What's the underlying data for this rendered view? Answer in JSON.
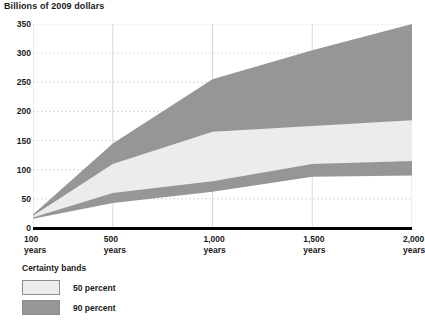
{
  "chart_data": {
    "type": "area",
    "title": "",
    "ylabel": "Billions of 2009 dollars",
    "xlabel": "",
    "grid": true,
    "legend_position": "below-left",
    "ylim": [
      0,
      350
    ],
    "xlim": [
      100,
      2000
    ],
    "y_ticks": [
      "350",
      "300",
      "250",
      "200",
      "150",
      "100",
      "50",
      "0"
    ],
    "y_tick_values": [
      350,
      300,
      250,
      200,
      150,
      100,
      50,
      0
    ],
    "x_ticks": [
      {
        "num": "100",
        "unit": "years"
      },
      {
        "num": "500",
        "unit": "years"
      },
      {
        "num": "1,000",
        "unit": "years"
      },
      {
        "num": "1,500",
        "unit": "years"
      },
      {
        "num": "2,000",
        "unit": "years"
      }
    ],
    "x_tick_values": [
      100,
      500,
      1000,
      1500,
      2000
    ],
    "x": [
      100,
      500,
      1000,
      1500,
      2000
    ],
    "series": [
      {
        "name": "90 percent upper",
        "values": [
          23,
          145,
          255,
          305,
          350
        ]
      },
      {
        "name": "50 percent upper",
        "values": [
          21,
          110,
          165,
          175,
          185
        ]
      },
      {
        "name": "50 percent lower",
        "values": [
          18,
          60,
          80,
          110,
          115
        ]
      },
      {
        "name": "90 percent lower",
        "values": [
          16,
          43,
          62,
          88,
          90
        ]
      }
    ],
    "bands": [
      {
        "name": "90 percent",
        "color": "#969696",
        "upper": [
          23,
          145,
          255,
          305,
          350
        ],
        "lower": [
          16,
          43,
          62,
          88,
          90
        ]
      },
      {
        "name": "50 percent",
        "color": "#ececec",
        "upper": [
          21,
          110,
          165,
          175,
          185
        ],
        "lower": [
          18,
          60,
          80,
          110,
          115
        ]
      }
    ],
    "colors": {
      "band_90": "#969696",
      "band_50": "#ececec",
      "gridline": "#c8c8c8",
      "axis": "#000000",
      "text": "#1a1a1a"
    }
  },
  "legend": {
    "title": "Certainty bands",
    "items": [
      {
        "label": "50 percent",
        "color": "#ececec"
      },
      {
        "label": "90 percent",
        "color": "#969696"
      }
    ]
  }
}
